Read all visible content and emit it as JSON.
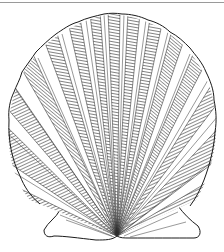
{
  "image": {
    "subject": "scallop shell",
    "style": "pen-and-ink engraving",
    "width": 224,
    "height": 252
  },
  "colors": {
    "background": "#ffffff",
    "ink": "#1a1a1a",
    "border": "#9a9a9a"
  },
  "shell": {
    "hinge": [
      117,
      236
    ],
    "rib_count": 17,
    "top_y": 14,
    "left_x": 8,
    "right_x": 216
  }
}
